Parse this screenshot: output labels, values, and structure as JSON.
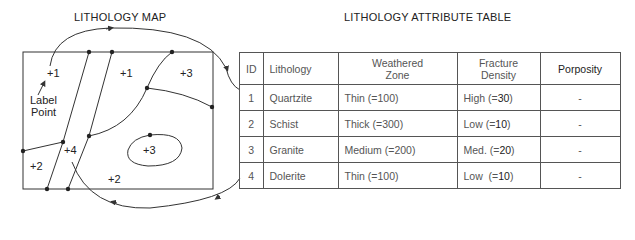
{
  "map": {
    "title": "LITHOLOGY MAP",
    "label_point_text_line1": "Label",
    "label_point_text_line2": "Point",
    "polygon_labels": [
      {
        "text": "+1",
        "x": 47,
        "y": 77
      },
      {
        "text": "+1",
        "x": 120,
        "y": 77
      },
      {
        "text": "+3",
        "x": 180,
        "y": 77
      },
      {
        "text": "+4",
        "x": 64,
        "y": 154
      },
      {
        "text": "+3",
        "x": 143,
        "y": 154
      },
      {
        "text": "+2",
        "x": 30,
        "y": 170
      },
      {
        "text": "+2",
        "x": 108,
        "y": 183
      }
    ]
  },
  "table": {
    "title": "LITHOLOGY ATTRIBUTE TABLE",
    "headers": {
      "id": "ID",
      "lithology": "Lithology",
      "weathered_zone_line1": "Weathered",
      "weathered_zone_line2": "Zone",
      "fracture_density_line1": "Fracture",
      "fracture_density_line2": "Density",
      "porosity": "Porposity"
    },
    "rows": [
      {
        "id": "1",
        "lithology": "Quartzite",
        "weathered_zone": "Thin (=100)",
        "fracture_density_prefix": "High (=",
        "fracture_density_value": "30",
        "fracture_density_suffix": ")",
        "porosity": "-"
      },
      {
        "id": "2",
        "lithology": "Schist",
        "weathered_zone": "Thick (=300)",
        "fracture_density_prefix": "Low (=",
        "fracture_density_value": "10",
        "fracture_density_suffix": ")",
        "porosity": "-"
      },
      {
        "id": "3",
        "lithology": "Granite",
        "weathered_zone": "Medium (=200)",
        "fracture_density_prefix": "Med. (=",
        "fracture_density_value": "20",
        "fracture_density_suffix": ")",
        "porosity": "-"
      },
      {
        "id": "4",
        "lithology": "Dolerite",
        "weathered_zone": "Thin (=100)",
        "fracture_density_prefix": "Low  (=",
        "fracture_density_value": "10",
        "fracture_density_suffix": ")",
        "porosity": "-"
      }
    ]
  }
}
